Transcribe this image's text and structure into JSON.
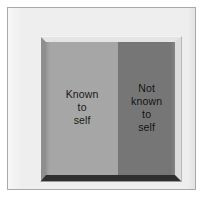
{
  "diagram": {
    "frame": {
      "bevel_top_color": "#e4e4e4",
      "bevel_left_color": "#8e8e8e",
      "bevel_right_color": "#dcdcdc",
      "bevel_bottom_color": "#2e2e2e"
    },
    "background_color": "#eeeeee",
    "border_color": "#a9a9a9",
    "panels": [
      {
        "id": "known-to-self",
        "label": "Known\nto\nself",
        "fill_color": "#a6a6a6",
        "text_color": "#151515",
        "width_percent": 56
      },
      {
        "id": "not-known-to-self",
        "label": "Not\nknown\nto\nself",
        "fill_color": "#767676",
        "text_color": "#0e0e0e",
        "width_percent": 44
      }
    ]
  }
}
